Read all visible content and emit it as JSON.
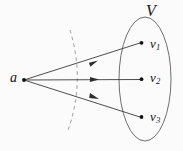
{
  "figure": {
    "title_label": "V",
    "source_label": "a",
    "background_color": "#fbfbfb",
    "stroke_color": "#3a3a3a",
    "dot_color": "#111111",
    "dashed_color": "#8f8f8f",
    "ellipse_color": "#6e6e6e",
    "labels": {
      "set_label": "V",
      "source": "a",
      "targets": [
        {
          "base": "v",
          "sub": "1"
        },
        {
          "base": "v",
          "sub": "2"
        },
        {
          "base": "v",
          "sub": "3"
        }
      ]
    },
    "geometry": {
      "source_point": {
        "x": 24,
        "y": 80
      },
      "target_points": [
        {
          "x": 141,
          "y": 43
        },
        {
          "x": 141,
          "y": 79
        },
        {
          "x": 141,
          "y": 117
        }
      ],
      "arrow_midpoints": [
        {
          "x": 93,
          "y": 62
        },
        {
          "x": 95,
          "y": 79
        },
        {
          "x": 94,
          "y": 99
        }
      ],
      "ellipse": {
        "cx": 145,
        "cy": 79,
        "rx": 26,
        "ry": 62
      },
      "dashed_arc": {
        "top": {
          "x": 70,
          "y": 30
        },
        "mid": {
          "x": 81,
          "y": 83
        },
        "bottom": {
          "x": 67,
          "y": 133
        }
      }
    }
  }
}
